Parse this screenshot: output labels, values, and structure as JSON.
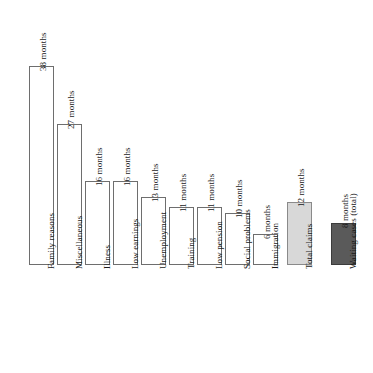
{
  "chart_data": {
    "type": "bar",
    "title": "",
    "subtitle": "",
    "xlabel": "",
    "ylabel": "",
    "unit": "months",
    "grid": false,
    "legend": false,
    "ylim": [
      0,
      38
    ],
    "categories": [
      "Family reasons",
      "Miscellaneous",
      "Illness",
      "Low earnings",
      "Unemployment",
      "Training",
      "Low pension",
      "Social problems",
      "Immigration",
      "Total claims",
      "Waiting cases (total)"
    ],
    "values": [
      38,
      27,
      16,
      16,
      13,
      11,
      11,
      10,
      6,
      12,
      8
    ],
    "value_labels": [
      "38 months",
      "27 months",
      "16 months",
      "16 months",
      "13 months",
      "11 months",
      "11 months",
      "10 months",
      "6 months",
      "12 months",
      "8 months"
    ],
    "bar_styles": [
      "white",
      "white",
      "white",
      "white",
      "white",
      "white",
      "white",
      "white",
      "white",
      "light",
      "dark"
    ]
  },
  "colors": {
    "bar_white": "#ffffff",
    "bar_light_gray": "#d8d8d8",
    "bar_dark_gray": "#5a5a5a",
    "bar_outline": "#7d7d7d",
    "text": "#1a1a1a",
    "background": "#ffffff"
  }
}
